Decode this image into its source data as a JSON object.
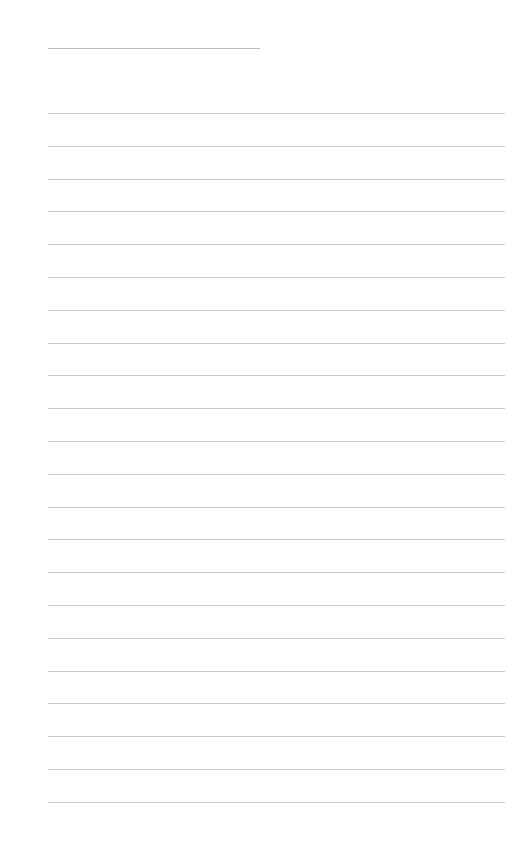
{
  "page": {
    "type": "lined-paper",
    "background": "#ffffff",
    "line_color": "#c9c9c9",
    "title_line": {
      "x": 48,
      "y": 48,
      "width": 212
    },
    "rules": {
      "x": 48,
      "width": 457,
      "start_y": 113,
      "spacing": 32.8,
      "count": 22
    }
  }
}
